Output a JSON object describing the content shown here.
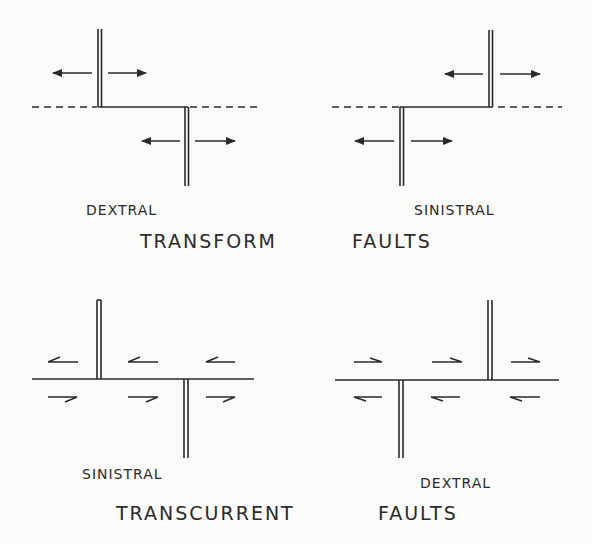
{
  "figure": {
    "colors": {
      "ink": "#2a2a2a",
      "background": "#fbfbfa"
    },
    "top": {
      "left_label": "DEXTRAL",
      "right_label": "SINISTRAL",
      "caption_left": "TRANSFORM",
      "caption_right": "FAULTS"
    },
    "bottom": {
      "left_label": "SINISTRAL",
      "right_label": "DEXTRAL",
      "caption_left": "TRANSCURRENT",
      "caption_right": "FAULTS"
    },
    "panels": [
      {
        "id": "dextral-transform",
        "type": "transform",
        "sense": "dextral"
      },
      {
        "id": "sinistral-transform",
        "type": "transform",
        "sense": "sinistral"
      },
      {
        "id": "sinistral-transcurrent",
        "type": "transcurrent",
        "sense": "sinistral"
      },
      {
        "id": "dextral-transcurrent",
        "type": "transcurrent",
        "sense": "dextral"
      }
    ]
  }
}
